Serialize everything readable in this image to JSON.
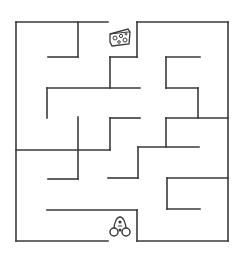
{
  "puzzle": {
    "type": "maze",
    "wall_color": "#3a3a3a",
    "background": "#ffffff",
    "goal": {
      "icon": "cheese-icon",
      "x": 108,
      "y": 28
    },
    "start": {
      "icon": "mouse-icon",
      "x": 108,
      "y": 214
    },
    "walls": [
      [
        16,
        22,
        108,
        22
      ],
      [
        137,
        22,
        228,
        22
      ],
      [
        16,
        22,
        16,
        241
      ],
      [
        228,
        22,
        228,
        241
      ],
      [
        16,
        241,
        108,
        241
      ],
      [
        137,
        241,
        228,
        241
      ],
      [
        78,
        22,
        78,
        57
      ],
      [
        48,
        57,
        78,
        57
      ],
      [
        137,
        22,
        137,
        57
      ],
      [
        110,
        57,
        137,
        57
      ],
      [
        110,
        57,
        110,
        88
      ],
      [
        47,
        88,
        140,
        88
      ],
      [
        47,
        88,
        47,
        118
      ],
      [
        166,
        57,
        200,
        57
      ],
      [
        166,
        57,
        166,
        88
      ],
      [
        166,
        88,
        198,
        88
      ],
      [
        198,
        88,
        198,
        118
      ],
      [
        166,
        118,
        228,
        118
      ],
      [
        166,
        118,
        166,
        147
      ],
      [
        110,
        118,
        140,
        118
      ],
      [
        110,
        118,
        110,
        150
      ],
      [
        78,
        117,
        78,
        179
      ],
      [
        16,
        150,
        110,
        150
      ],
      [
        48,
        179,
        78,
        179
      ],
      [
        138,
        147,
        199,
        147
      ],
      [
        138,
        147,
        138,
        178
      ],
      [
        108,
        178,
        138,
        178
      ],
      [
        167,
        178,
        228,
        178
      ],
      [
        167,
        178,
        167,
        209
      ],
      [
        167,
        209,
        200,
        209
      ],
      [
        47,
        210,
        137,
        210
      ],
      [
        137,
        210,
        137,
        241
      ]
    ]
  }
}
